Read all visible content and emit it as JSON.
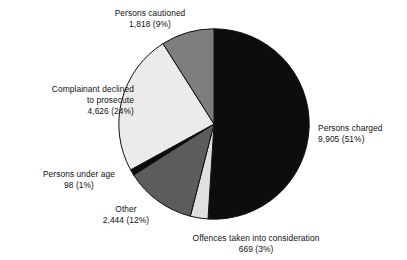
{
  "chart_data": {
    "type": "pie",
    "title": "",
    "subtitle": "",
    "xlabel": "",
    "ylabel": "",
    "legend": "none",
    "grid": false,
    "start_angle_deg": 0,
    "direction": "clockwise",
    "total": 19560,
    "categories": [
      "Persons charged",
      "Offences taken into consideration",
      "Other",
      "Persons under age",
      "Complainant declined to prosecute",
      "Persons cautioned"
    ],
    "values": [
      9905,
      669,
      2444,
      98,
      4626,
      1818
    ],
    "percentages": [
      51,
      3,
      12,
      1,
      24,
      9
    ],
    "value_labels": [
      "9,905",
      "669",
      "2,444",
      "98",
      "4,626",
      "1,818"
    ],
    "percent_labels": [
      "(51%)",
      "(3%)",
      "(12%)",
      "(1%)",
      "(24%)",
      "(9%)"
    ],
    "colors": [
      "#0d0d0d",
      "#e0e0e0",
      "#5c5c5c",
      "#0d0d0d",
      "#ebebeb",
      "#7e7e7e"
    ],
    "slice_edge_color": "#101010",
    "background_color": "#ffffff"
  },
  "slices": [
    {
      "key": "persons-charged",
      "name": "Persons charged",
      "value_line": "9,905 (51%)",
      "color": "#0d0d0d",
      "start_deg": 0,
      "end_deg": 183.6
    },
    {
      "key": "offences-taken-into-consideration",
      "name": "Offences taken into consideration",
      "value_line": "669 (3%)",
      "color": "#e0e0e0",
      "start_deg": 183.6,
      "end_deg": 194.4
    },
    {
      "key": "other",
      "name": "Other",
      "value_line": "2,444 (12%)",
      "color": "#5c5c5c",
      "start_deg": 194.4,
      "end_deg": 237.6
    },
    {
      "key": "persons-under-age",
      "name": "Persons under age",
      "value_line": "98 (1%)",
      "color": "#0d0d0d",
      "start_deg": 237.6,
      "end_deg": 241.2
    },
    {
      "key": "complainant-declined-to-prosecute",
      "name": "Complainant declined to prosecute",
      "value_line": "4,626 (24%)",
      "color": "#ebebeb",
      "start_deg": 241.2,
      "end_deg": 327.6
    },
    {
      "key": "persons-cautioned",
      "name": "Persons cautioned",
      "value_line": "1,818 (9%)",
      "color": "#7e7e7e",
      "start_deg": 327.6,
      "end_deg": 360
    }
  ],
  "labels": {
    "cautioned": {
      "line1": "Persons cautioned",
      "line2": "1,818 (9%)"
    },
    "declined": {
      "line1": "Complainant declined",
      "line2": "to prosecute",
      "line3": "4,626 (24%)"
    },
    "under_age": {
      "line1": "Persons under age",
      "line2": "98 (1%)"
    },
    "other": {
      "line1": "Other",
      "line2": "2,444 (12%)"
    },
    "offences": {
      "line1": "Offences taken into consideration",
      "line2": "669 (3%)"
    },
    "charged": {
      "line1": "Persons charged",
      "line2": "9,905 (51%)"
    }
  }
}
